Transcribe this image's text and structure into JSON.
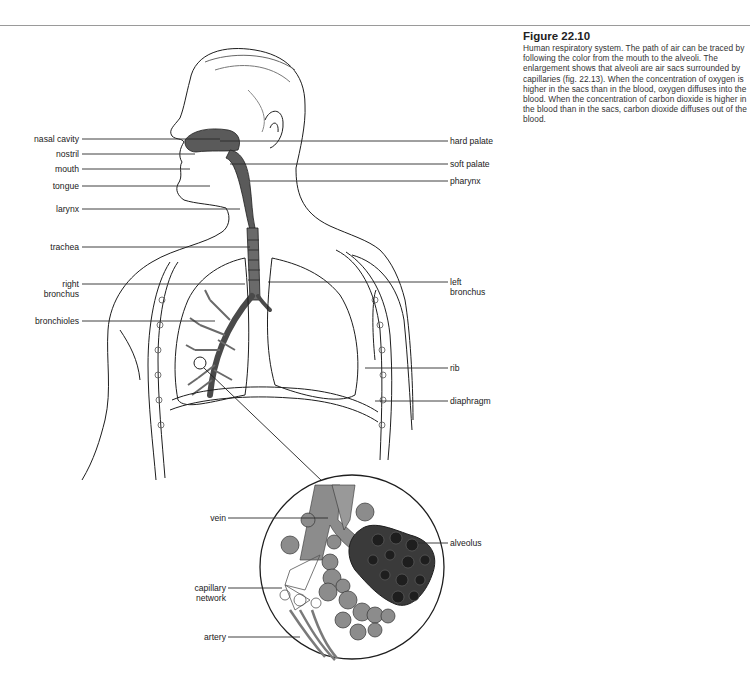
{
  "caption": {
    "figure_number": "Figure 22.10",
    "text": "Human respiratory system. The path of air can be traced by following the color from the mouth to the alveoli. The enlargement shows that alveoli are air sacs surrounded by capillaries (fig. 22.13). When the concentration of oxygen is higher in the sacs than in the blood, oxygen diffuses into the blood. When the concentration of carbon dioxide is higher in the blood than in the sacs, carbon dioxide diffuses out of the blood."
  },
  "labels_left": {
    "nasal_cavity": "nasal cavity",
    "nostril": "nostril",
    "mouth": "mouth",
    "tongue": "tongue",
    "larynx": "larynx",
    "trachea": "trachea",
    "right_bronchus_1": "right",
    "right_bronchus_2": "bronchus",
    "bronchioles": "bronchioles"
  },
  "labels_right": {
    "hard_palate": "hard palate",
    "soft_palate": "soft palate",
    "pharynx": "pharynx",
    "left_bronchus_1": "left",
    "left_bronchus_2": "bronchus",
    "rib": "rib",
    "diaphragm": "diaphragm"
  },
  "labels_inset": {
    "vein": "vein",
    "alveolus": "alveolus",
    "capillary_network_1": "capillary",
    "capillary_network_2": "network",
    "artery": "artery"
  },
  "colors": {
    "airway": "#5a5a5a",
    "airway_light": "#8c8c8c",
    "outline": "#1e1e1e",
    "leader": "#2a2a2a"
  }
}
